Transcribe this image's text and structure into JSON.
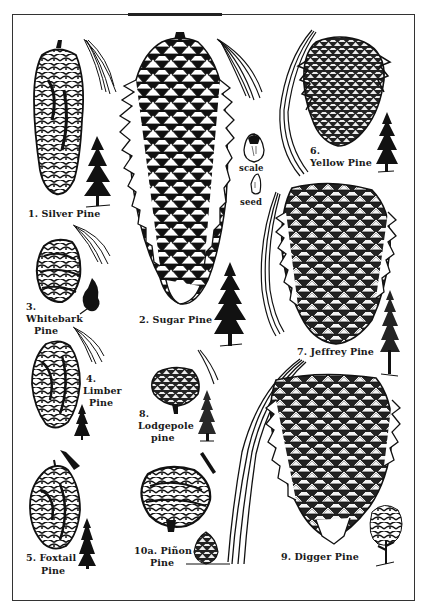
{
  "plate": {
    "description": "Illustrated plate of California pine cones, needles, and tree silhouettes",
    "colors": {
      "ink": "#111111",
      "paper": "#ffffff",
      "frame": "#333333"
    }
  },
  "specimens": [
    {
      "id": "1",
      "number": "1.",
      "name": "Silver Pine",
      "label": "1. Silver Pine"
    },
    {
      "id": "2",
      "number": "2.",
      "name": "Sugar Pine",
      "label": "2. Sugar Pine"
    },
    {
      "id": "3",
      "number": "3.",
      "name": "Whitebark Pine",
      "label_lines": [
        "3.",
        "Whitebark",
        "Pine"
      ]
    },
    {
      "id": "4",
      "number": "4.",
      "name": "Limber Pine",
      "label_lines": [
        "4.",
        "Limber",
        "Pine"
      ]
    },
    {
      "id": "5",
      "number": "5.",
      "name": "Foxtail Pine",
      "label_lines": [
        "5. Foxtail",
        "Pine"
      ]
    },
    {
      "id": "6",
      "number": "6.",
      "name": "Yellow Pine",
      "label_lines": [
        "6.",
        "Yellow Pine"
      ]
    },
    {
      "id": "7",
      "number": "7.",
      "name": "Jeffrey Pine",
      "label": "7. Jeffrey Pine"
    },
    {
      "id": "8",
      "number": "8.",
      "name": "Lodgepole pine",
      "label_lines": [
        "8.",
        "Lodgepole",
        "pine"
      ]
    },
    {
      "id": "9",
      "number": "9.",
      "name": "Digger Pine",
      "label": "9. Digger Pine"
    },
    {
      "id": "10a",
      "number": "10a.",
      "name": "Piñon Pine",
      "label_lines": [
        "10a. Piñon",
        "Pine"
      ]
    }
  ],
  "annotations": {
    "scale": "scale",
    "seed": "seed"
  }
}
